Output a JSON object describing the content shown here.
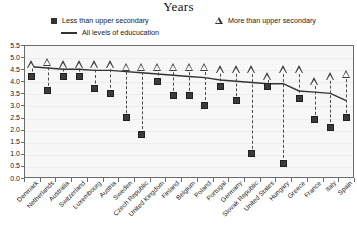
{
  "chart_data": {
    "type": "scatter",
    "title": "Years",
    "xlabel": "",
    "ylabel": "Years",
    "ylim": [
      0.0,
      5.5
    ],
    "ytick_labels": [
      "5.5",
      "5.0",
      "4.5",
      "4.0",
      "3.5",
      "3.0",
      "2.5",
      "2.0",
      "1.5",
      "1.0",
      "0.5",
      "0.0"
    ],
    "ytick_values": [
      5.5,
      5.0,
      4.5,
      4.0,
      3.5,
      3.0,
      2.5,
      2.0,
      1.5,
      1.0,
      0.5,
      0.0
    ],
    "grid": true,
    "legend_position": "top",
    "categories": [
      "Denmark",
      "Netherlands",
      "Australia",
      "Switzerland",
      "Luxembourg",
      "Austria",
      "Sweden",
      "Czech Republic",
      "United Kingdom",
      "Finland",
      "Belgium",
      "Poland",
      "Portugal",
      "Germany",
      "Slovak Republic",
      "United States",
      "Hungary",
      "Greece",
      "France",
      "Italy",
      "Spain"
    ],
    "series": [
      {
        "name": "Less than upper secondary",
        "marker": "square",
        "values": [
          4.2,
          3.6,
          4.2,
          4.2,
          3.7,
          3.5,
          2.5,
          1.8,
          4.0,
          3.4,
          3.4,
          3.0,
          3.8,
          3.2,
          1.0,
          3.8,
          0.6,
          3.3,
          2.4,
          2.1,
          2.5
        ]
      },
      {
        "name": "More than upper secondary",
        "marker": "triangle",
        "values": [
          4.7,
          4.8,
          4.7,
          4.7,
          4.7,
          4.7,
          4.6,
          4.6,
          4.6,
          4.6,
          4.6,
          4.6,
          4.5,
          4.5,
          4.5,
          4.2,
          4.5,
          4.5,
          4.0,
          4.2,
          4.3
        ]
      },
      {
        "name": "All levels of educucation",
        "marker": "line",
        "values": [
          4.6,
          4.55,
          4.5,
          4.5,
          4.45,
          4.45,
          4.4,
          4.35,
          4.3,
          4.25,
          4.2,
          4.15,
          4.05,
          4.0,
          3.95,
          3.9,
          3.9,
          3.6,
          3.55,
          3.5,
          3.2
        ]
      }
    ]
  },
  "legend": {
    "item_1": "Less than upper secondary",
    "item_2": "More than upper secondary",
    "item_3": "All levels of educucation"
  },
  "colors": {
    "marker": "#3b3b3b",
    "line": "#333333",
    "plot_background": "#f7f7f7",
    "frame": "#6b6b6b",
    "grid": "#ededed"
  }
}
